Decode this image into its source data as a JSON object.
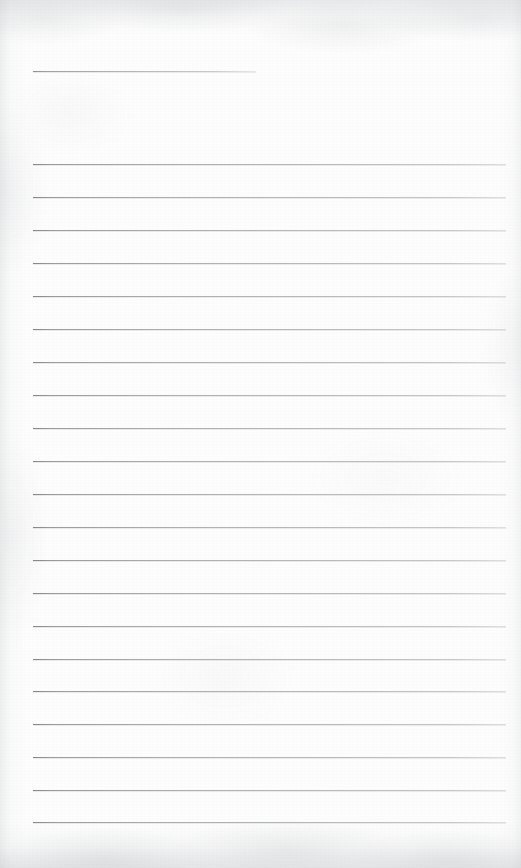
{
  "document": {
    "kind": "scanned-lined-paper",
    "title": "",
    "body_text": "",
    "page_width": 521,
    "page_height": 868,
    "background_color": "#fdfdfd",
    "rule_color": "#9a9ea3",
    "is_blank": true,
    "visible_text": ""
  },
  "header_rule": {
    "name": "title-rule",
    "x": 33,
    "y": 71,
    "width": 223,
    "label": ""
  },
  "ruled_lines": {
    "count": 21,
    "first_y": 164,
    "spacing": 32.9,
    "left_x": 33,
    "right_x": 506,
    "lines": [
      {
        "index": 1,
        "y": 164,
        "text": ""
      },
      {
        "index": 2,
        "y": 197,
        "text": ""
      },
      {
        "index": 3,
        "y": 230,
        "text": ""
      },
      {
        "index": 4,
        "y": 263,
        "text": ""
      },
      {
        "index": 5,
        "y": 296,
        "text": ""
      },
      {
        "index": 6,
        "y": 329,
        "text": ""
      },
      {
        "index": 7,
        "y": 362,
        "text": ""
      },
      {
        "index": 8,
        "y": 395,
        "text": ""
      },
      {
        "index": 9,
        "y": 428,
        "text": ""
      },
      {
        "index": 10,
        "y": 461,
        "text": ""
      },
      {
        "index": 11,
        "y": 494,
        "text": ""
      },
      {
        "index": 12,
        "y": 527,
        "text": ""
      },
      {
        "index": 13,
        "y": 560,
        "text": ""
      },
      {
        "index": 14,
        "y": 593,
        "text": ""
      },
      {
        "index": 15,
        "y": 626,
        "text": ""
      },
      {
        "index": 16,
        "y": 659,
        "text": ""
      },
      {
        "index": 17,
        "y": 691,
        "text": ""
      },
      {
        "index": 18,
        "y": 724,
        "text": ""
      },
      {
        "index": 19,
        "y": 757,
        "text": ""
      },
      {
        "index": 20,
        "y": 790,
        "text": ""
      },
      {
        "index": 21,
        "y": 822,
        "text": ""
      }
    ]
  }
}
